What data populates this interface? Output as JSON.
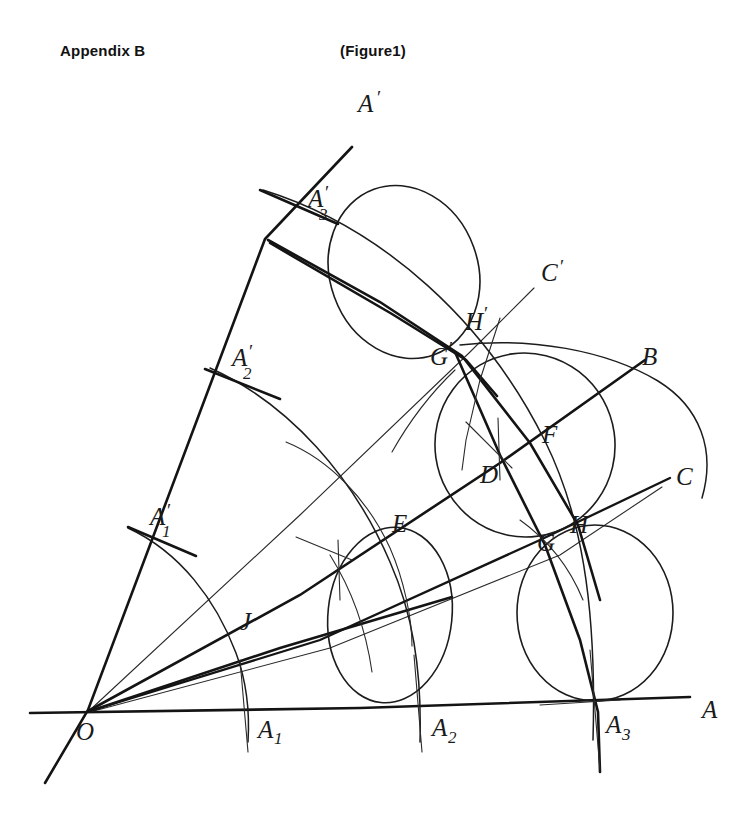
{
  "header": {
    "appendix_label": "Appendix B",
    "figure_label": "(Figure1)"
  },
  "figure": {
    "labels": {
      "A_prime": "A",
      "A_prime_mark": "′",
      "A_prime_3_base": "A",
      "A_prime_3_sub": "3",
      "A_prime_2_base": "A",
      "A_prime_2_sub": "2",
      "A_prime_1_base": "A",
      "A_prime_1_sub": "1",
      "C_prime": "C",
      "C_prime_mark": "′",
      "B": "B",
      "C": "C",
      "A": "A",
      "O": "O",
      "J": "J",
      "E": "E",
      "D": "D",
      "F": "F",
      "G": "G",
      "H": "H",
      "G_prime_base": "G",
      "G_prime_mark": "′",
      "H_prime_base": "H",
      "H_prime_mark": "′",
      "A1_base": "A",
      "A1_sub": "1",
      "A2_base": "A",
      "A2_sub": "2",
      "A3_base": "A",
      "A3_sub": "3"
    },
    "colors": {
      "ink": "#141414",
      "paper": "#ffffff",
      "thin_ink": "#2a2a2a"
    },
    "geometry_notes": {
      "origin_point": "O",
      "axis_ray_label": "A",
      "upper_ray_label": "A′",
      "intermediate_rays": [
        "C",
        "B",
        "C′"
      ],
      "axis_points": [
        "A1",
        "A2",
        "A3"
      ],
      "upper_ray_points": [
        "A′1",
        "A′2",
        "A′3"
      ],
      "tangent_points": [
        "J",
        "E",
        "D",
        "F",
        "G",
        "H",
        "G′",
        "H′"
      ],
      "circle_count": 4,
      "arc_count": 3
    }
  }
}
